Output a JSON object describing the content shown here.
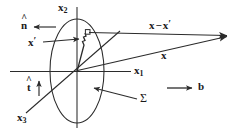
{
  "figure": {
    "type": "vector-diagram",
    "background_color": "#ffffff",
    "stroke_color": "#2b2b2b",
    "text_color": "#1a1a1a"
  },
  "axes": [
    {
      "id": "x1",
      "base": "x",
      "subscript": "1",
      "label": "x1",
      "orientation": "horizontal-right"
    },
    {
      "id": "x2",
      "base": "x",
      "subscript": "2",
      "label": "x2",
      "orientation": "vertical-up"
    },
    {
      "id": "x3",
      "base": "x",
      "subscript": "3",
      "label": "x3",
      "orientation": "diagonal-down-left"
    }
  ],
  "vectors": [
    {
      "id": "n-hat",
      "base": "n",
      "hat": "^",
      "label": "n",
      "description": "surface normal unit vector, points left"
    },
    {
      "id": "t-hat",
      "base": "t",
      "hat": "^",
      "label": "t",
      "description": "tangent unit vector, points up"
    },
    {
      "id": "x-prime",
      "base": "x",
      "prime": "'",
      "label": "x'",
      "description": "source point position vector"
    },
    {
      "id": "x-vector",
      "base": "x",
      "label": "x",
      "description": "field point position vector"
    },
    {
      "id": "x-minus-x-prime",
      "label": "x - x'",
      "minus": "−",
      "description": "separation vector"
    },
    {
      "id": "b-vector",
      "base": "b",
      "label": "b",
      "description": "Burgers vector, points right"
    }
  ],
  "surface": {
    "id": "sigma",
    "label": "Σ",
    "description": "elliptical cut surface bounded by the dislocation loop"
  },
  "labels": {
    "x1": {
      "base": "x",
      "sub": "1"
    },
    "x2": {
      "base": "x",
      "sub": "2"
    },
    "x3": {
      "base": "x",
      "sub": "3"
    },
    "n_hat": {
      "base": "n",
      "hat": "^"
    },
    "t_hat": {
      "base": "t",
      "hat": "^"
    },
    "x_prime": {
      "base": "x",
      "prime": "′"
    },
    "x_plain": {
      "base": "x"
    },
    "x_minus_x_prime": {
      "base": "x",
      "op": "−",
      "second": "x",
      "prime": "′"
    },
    "b": {
      "base": "b"
    },
    "sigma": {
      "glyph": "Σ"
    }
  }
}
